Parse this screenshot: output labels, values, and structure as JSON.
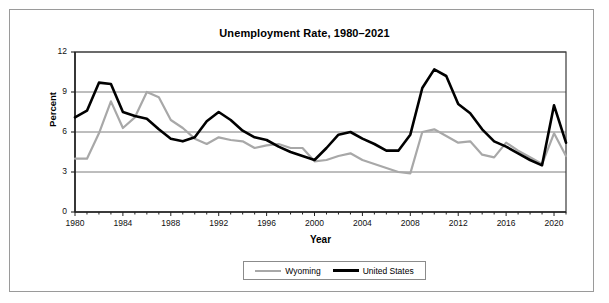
{
  "chart_data": {
    "type": "line",
    "title": "Unemployment Rate, 1980–2021",
    "xlabel": "Year",
    "ylabel": "Percent",
    "xlim": [
      1980,
      2021
    ],
    "ylim": [
      0,
      12
    ],
    "yticks": [
      0,
      3,
      6,
      9,
      12
    ],
    "xticks": [
      1980,
      1984,
      1988,
      1992,
      1996,
      2000,
      2004,
      2008,
      2012,
      2016,
      2020
    ],
    "grid": "horizontal",
    "legend_position": "bottom",
    "x": [
      1980,
      1981,
      1982,
      1983,
      1984,
      1985,
      1986,
      1987,
      1988,
      1989,
      1990,
      1991,
      1992,
      1993,
      1994,
      1995,
      1996,
      1997,
      1998,
      1999,
      2000,
      2001,
      2002,
      2003,
      2004,
      2005,
      2006,
      2007,
      2008,
      2009,
      2010,
      2011,
      2012,
      2013,
      2014,
      2015,
      2016,
      2017,
      2018,
      2019,
      2020,
      2021
    ],
    "series": [
      {
        "name": "Wyoming",
        "color": "#a8a8a8",
        "values": [
          4.0,
          4.0,
          5.9,
          8.3,
          6.3,
          7.1,
          9.0,
          8.6,
          6.9,
          6.3,
          5.5,
          5.1,
          5.6,
          5.4,
          5.3,
          4.8,
          5.0,
          5.1,
          4.8,
          4.8,
          3.8,
          3.9,
          4.2,
          4.4,
          3.9,
          3.6,
          3.3,
          3.0,
          2.9,
          6.0,
          6.2,
          5.7,
          5.2,
          5.3,
          4.3,
          4.1,
          5.2,
          4.6,
          4.1,
          3.6,
          5.9,
          4.2
        ]
      },
      {
        "name": "United States",
        "color": "#000000",
        "values": [
          7.1,
          7.6,
          9.7,
          9.6,
          7.5,
          7.2,
          7.0,
          6.2,
          5.5,
          5.3,
          5.6,
          6.8,
          7.5,
          6.9,
          6.1,
          5.6,
          5.4,
          4.9,
          4.5,
          4.2,
          3.9,
          4.8,
          5.8,
          6.0,
          5.5,
          5.1,
          4.6,
          4.6,
          5.8,
          9.3,
          10.7,
          10.2,
          8.1,
          7.4,
          6.2,
          5.3,
          4.9,
          4.4,
          3.9,
          3.5,
          8.0,
          5.2
        ]
      }
    ]
  },
  "legend": {
    "entries": [
      {
        "label": "Wyoming"
      },
      {
        "label": "United States"
      }
    ]
  }
}
